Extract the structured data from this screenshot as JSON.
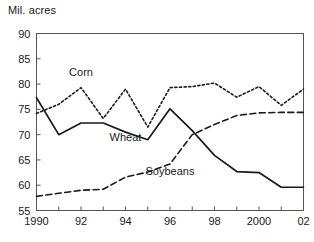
{
  "chart_data": {
    "type": "line",
    "title": "",
    "subtitle": "",
    "ylabel": "Mil. acres",
    "xlabel": "",
    "ylim": [
      55,
      90
    ],
    "yticks": [
      55,
      60,
      65,
      70,
      75,
      80,
      85,
      90
    ],
    "ytick_labels": [
      "55",
      "60",
      "65",
      "70",
      "75",
      "80",
      "85",
      "90"
    ],
    "xlim": [
      1990,
      2002
    ],
    "xticks": [
      1990,
      1991,
      1992,
      1993,
      1994,
      1995,
      1996,
      1997,
      1998,
      1999,
      2000,
      2001,
      2002
    ],
    "xtick_labels": [
      "1990",
      "",
      "92",
      "",
      "94",
      "",
      "96",
      "",
      "98",
      "",
      "2000",
      "",
      "02"
    ],
    "grid": false,
    "legend_position": "inline-annotations",
    "x": [
      1990,
      1991,
      1992,
      1993,
      1994,
      1995,
      1996,
      1997,
      1998,
      1999,
      2000,
      2001,
      2002
    ],
    "series": [
      {
        "name": "Corn",
        "style": "dotted",
        "label_x": 1992,
        "label_y": 81.5,
        "values": [
          74.2,
          76.0,
          79.3,
          73.2,
          79.0,
          71.5,
          79.3,
          79.5,
          80.2,
          77.4,
          79.5,
          75.8,
          79.0
        ]
      },
      {
        "name": "Wheat",
        "style": "solid",
        "label_x": 1994,
        "label_y": 68.8,
        "values": [
          77.3,
          70.0,
          72.3,
          72.3,
          70.5,
          69.0,
          75.1,
          70.8,
          65.9,
          62.7,
          62.5,
          59.6,
          59.6
        ]
      },
      {
        "name": "Soybeans",
        "style": "dashed",
        "label_x": 1996,
        "label_y": 62.0,
        "values": [
          57.8,
          58.4,
          59.0,
          59.2,
          61.6,
          62.6,
          64.2,
          70.0,
          72.0,
          73.8,
          74.3,
          74.4,
          74.4
        ]
      }
    ]
  }
}
